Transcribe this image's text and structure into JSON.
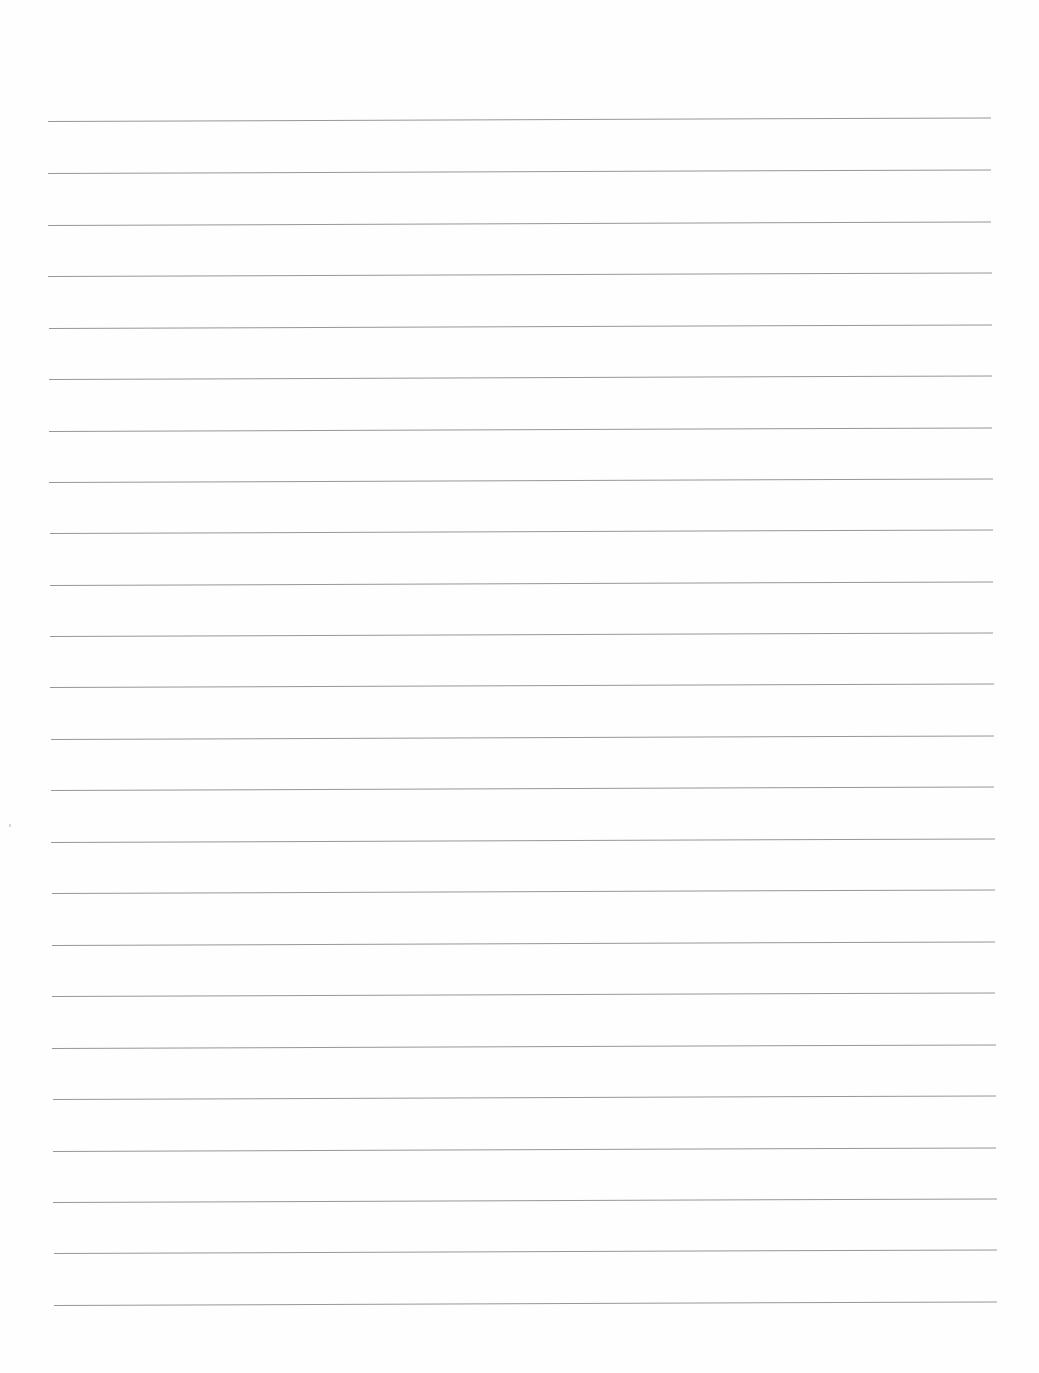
{
  "page": {
    "type": "blank lined paper",
    "background": "#fefefe",
    "rule_color": "#8c8c8c",
    "rule_count": 24,
    "rules": [
      {
        "y": 122,
        "x1": 48,
        "x2": 991
      },
      {
        "y": 174,
        "x1": 48,
        "x2": 991
      },
      {
        "y": 226,
        "x1": 48,
        "x2": 991
      },
      {
        "y": 277,
        "x1": 48,
        "x2": 992
      },
      {
        "y": 329,
        "x1": 49,
        "x2": 992
      },
      {
        "y": 380,
        "x1": 49,
        "x2": 992
      },
      {
        "y": 432,
        "x1": 49,
        "x2": 992
      },
      {
        "y": 483,
        "x1": 49,
        "x2": 993
      },
      {
        "y": 534,
        "x1": 50,
        "x2": 993
      },
      {
        "y": 586,
        "x1": 50,
        "x2": 993
      },
      {
        "y": 637,
        "x1": 50,
        "x2": 993
      },
      {
        "y": 688,
        "x1": 50,
        "x2": 994
      },
      {
        "y": 740,
        "x1": 51,
        "x2": 994
      },
      {
        "y": 791,
        "x1": 51,
        "x2": 994
      },
      {
        "y": 843,
        "x1": 51,
        "x2": 995
      },
      {
        "y": 894,
        "x1": 52,
        "x2": 995
      },
      {
        "y": 946,
        "x1": 52,
        "x2": 995
      },
      {
        "y": 997,
        "x1": 52,
        "x2": 995
      },
      {
        "y": 1049,
        "x1": 52,
        "x2": 996
      },
      {
        "y": 1100,
        "x1": 53,
        "x2": 996
      },
      {
        "y": 1152,
        "x1": 53,
        "x2": 996
      },
      {
        "y": 1203,
        "x1": 53,
        "x2": 997
      },
      {
        "y": 1254,
        "x1": 54,
        "x2": 997
      },
      {
        "y": 1306,
        "x1": 54,
        "x2": 997
      }
    ],
    "text": ""
  }
}
